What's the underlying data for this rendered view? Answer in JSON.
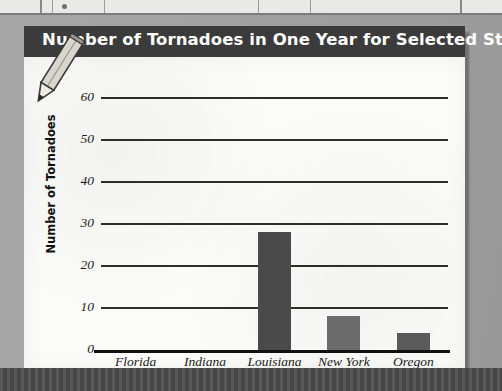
{
  "page": {
    "background_color": "#a2a2a2",
    "title_bar_color": "#3b3b3b",
    "card_color": "#fbfbf9",
    "decor": {
      "pencil_icon": "pencil-icon"
    }
  },
  "chart_data": {
    "type": "bar",
    "title": "Number of Tornadoes in One Year for Selected States",
    "xlabel": "State",
    "ylabel": "Number of Tornadoes",
    "categories": [
      "Florida",
      "Indiana",
      "Louisiana",
      "New York",
      "Oregon"
    ],
    "values": [
      0,
      0,
      28,
      8,
      4
    ],
    "ylim": [
      0,
      60
    ],
    "yticks": [
      "0",
      "10",
      "20",
      "30",
      "40",
      "50",
      "60"
    ],
    "ytick_values": [
      0,
      10,
      20,
      30,
      40,
      50,
      60
    ],
    "grid": true,
    "legend": false,
    "bar_colors": [
      "#4a4a4a",
      "#4a4a4a",
      "#4a4a4a",
      "#6b6b6b",
      "#5a5a5a"
    ]
  }
}
